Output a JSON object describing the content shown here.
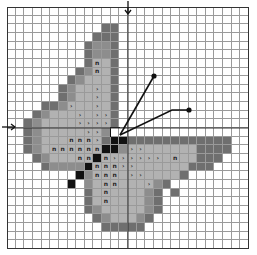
{
  "pattern": {
    "title": "Butterfly cross-stitch chart",
    "grid_size": 28,
    "legend": {
      ".": {
        "name": "empty",
        "color": "#ffffff"
      },
      "D": {
        "name": "dark-gray",
        "color": "#6f6f6f"
      },
      "M": {
        "name": "medium-gray",
        "color": "#8d8d8d"
      },
      "L": {
        "name": "light-gray",
        "color": "#b2b2b2"
      },
      "B": {
        "name": "black",
        "color": "#111111"
      },
      "X": {
        "name": "white-outlined",
        "color": "#ffffff"
      }
    },
    "symbols": {
      ">": "›",
      "n": "n"
    },
    "rows": [
      "............................",
      "............................",
      "...........DD...............",
      "..........DDD...............",
      ".........DMMD...............",
      ".........DMMD...............",
      ".........DLLD...............",
      "........DMLLD...............",
      ".......DMLLLD...............",
      "......DMLLLLD...............",
      "......DMLLLLD...............",
      "....DDMLLLLLD...............",
      "...DMLLLLLLLD...............",
      "..DMLLLLLLLLD...............",
      "..DMLLLLLLLMX...............",
      "..DMLLLLLLLDBBDDDDDDDDDDDD..",
      "..DMLLLLLLLBBMLLLLLLLLDDDD..",
      "...DMLLLLLBLLLLLLLLLLLDDD...",
      "....DMMMMBLLLLLLLLLLLDDD....",
      "........BMLLLLLLLLLLD.......",
      ".......B.MLLLLLLLMD.........",
      ".........DLLLLLLMD.D........",
      ".........DLLLLLLMD..........",
      ".........DMLLLLLMD..........",
      "..........DMLLLMD...........",
      "...........DDDDD............",
      "............................",
      "............................"
    ],
    "marks": [
      "............................",
      "............................",
      "............................",
      "............................",
      "............................",
      "............................",
      "..........n.................",
      "..........n.................",
      "............................",
      "..........>.................",
      "..........>.................",
      ".......>..>.................",
      "........>.>>................",
      "........>>>>................",
      ".........>>.................",
      ".......nnn>.................",
      ".....nnnnnn...>>............",
      "........nn.n>>>>>>.n........",
      "..........nnn>>.............",
      "..........nnn.>>............",
      "...........nn...>...........",
      "...........n................",
      "...........n................",
      "............................",
      "............................",
      "............................",
      "............................",
      "............................"
    ],
    "center_arrows": {
      "top": "↓",
      "left": "→"
    },
    "antennae": [
      {
        "from": [
          120,
          135
        ],
        "to": [
          154,
          76
        ]
      },
      {
        "from": [
          120,
          135
        ],
        "via": [
          172,
          110
        ],
        "to": [
          189,
          110
        ]
      }
    ]
  }
}
